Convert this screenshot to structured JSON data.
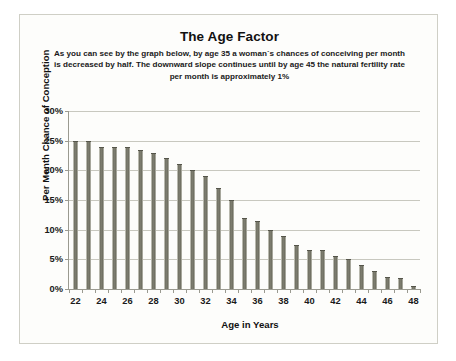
{
  "chart_data": {
    "type": "bar",
    "title": "The Age Factor",
    "subtitle": "As you can see by the graph below, by age 35 a woman`s chances of conceiving per month is decreased by half.  The downward slope continues until by age 45 the natural fertility rate per month is approximately 1%",
    "xlabel": "Age in Years",
    "ylabel": "Per Month Chance of Conception",
    "grid": true,
    "legend": "none",
    "ylim": [
      0,
      30
    ],
    "ytick_labels": [
      "0%",
      "5%",
      "10%",
      "15%",
      "20%",
      "25%",
      "30%"
    ],
    "ytick_values": [
      0,
      5,
      10,
      15,
      20,
      25,
      30
    ],
    "xtick_labels": [
      "22",
      "24",
      "26",
      "28",
      "30",
      "32",
      "34",
      "36",
      "38",
      "40",
      "42",
      "44",
      "46",
      "48"
    ],
    "categories": [
      22,
      23,
      24,
      25,
      26,
      27,
      28,
      29,
      30,
      31,
      32,
      33,
      34,
      35,
      36,
      37,
      38,
      39,
      40,
      41,
      42,
      43,
      44,
      45,
      46,
      47,
      48
    ],
    "values": [
      25,
      25,
      24,
      24,
      24,
      23.5,
      23,
      22,
      21,
      20,
      19,
      17,
      15,
      12,
      11.5,
      10,
      9,
      7.5,
      6.5,
      6.5,
      5.5,
      5,
      4,
      3,
      2,
      1.8,
      0.5
    ],
    "bar_color": "#77776a",
    "grid_color": "#c8c8bf",
    "axis_color": "#9a9a90",
    "background": "#fdfdfb"
  }
}
